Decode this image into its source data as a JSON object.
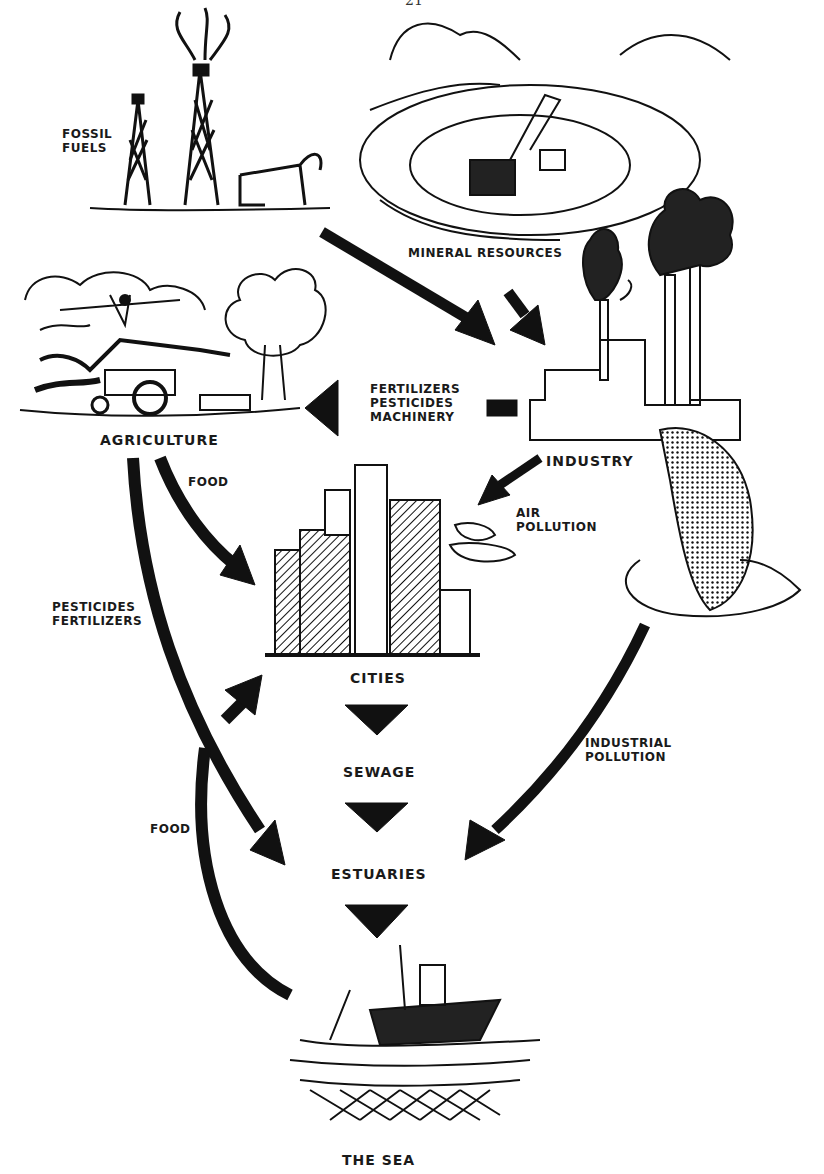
{
  "page": {
    "number": "21"
  },
  "nodes": {
    "fossil_fuels": "FOSSIL\nFUELS",
    "mineral_resources": "MINERAL RESOURCES",
    "agriculture": "AGRICULTURE",
    "industry": "INDUSTRY",
    "cities": "CITIES",
    "sewage": "SEWAGE",
    "estuaries": "ESTUARIES",
    "the_sea": "THE SEA"
  },
  "flows": {
    "fertilizers_pesticides_machinery": "FERTILIZERS\nPESTICIDES\nMACHINERY",
    "food_agriculture_to_cities": "FOOD",
    "air_pollution": "AIR\nPOLLUTION",
    "pesticides_fertilizers": "PESTICIDES\nFERTILIZERS",
    "industrial_pollution": "INDUSTRIAL\nPOLLUTION",
    "food_sea_to_cities": "FOOD"
  }
}
